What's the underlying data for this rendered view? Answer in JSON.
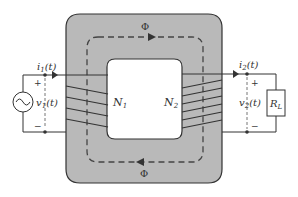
{
  "diagram": {
    "core": {
      "fill": "#b9b9b9",
      "stroke": "#333333"
    },
    "flux": {
      "top_label": "Φ",
      "bottom_label": "Φ"
    },
    "primary": {
      "current_label": "i1(t)",
      "current_main": "i",
      "current_sub": "1",
      "current_tail": "(t)",
      "voltage_main": "v",
      "voltage_sub": "1",
      "voltage_tail": "(t)",
      "plus": "+",
      "minus": "−",
      "turns_main": "N",
      "turns_sub": "1",
      "source_icon": "ac-source"
    },
    "secondary": {
      "current_main": "i",
      "current_sub": "2",
      "current_tail": "(t)",
      "voltage_main": "v",
      "voltage_sub": "2",
      "voltage_tail": "(t)",
      "plus": "+",
      "minus": "−",
      "turns_main": "N",
      "turns_sub": "2",
      "load_main": "R",
      "load_sub": "L"
    }
  }
}
